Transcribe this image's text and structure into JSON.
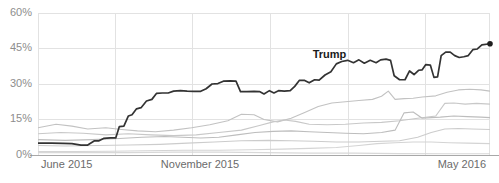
{
  "chart_data": {
    "type": "line",
    "title": "",
    "xlabel": "",
    "ylabel": "",
    "ylim": [
      0,
      60
    ],
    "yticks": [
      0,
      15,
      30,
      45,
      60
    ],
    "ytick_labels": [
      "0%",
      "15%",
      "30%",
      "45%",
      "60%"
    ],
    "xtick_labels": [
      "June 2015",
      "November 2015",
      "May 2016"
    ],
    "xlim": [
      "June 2015",
      "May 2016"
    ],
    "grid": true,
    "legend_position": "inline-annotation",
    "annotations": [
      {
        "text": "Trump",
        "x_frac": 0.645,
        "value": 41.5
      }
    ],
    "series": [
      {
        "name": "Trump",
        "color": "#333333",
        "highlight": true,
        "end_marker": true,
        "end_value": 47,
        "points": [
          [
            0.0,
            5.0
          ],
          [
            0.03,
            5.0
          ],
          [
            0.055,
            4.9
          ],
          [
            0.075,
            4.8
          ],
          [
            0.095,
            4.2
          ],
          [
            0.11,
            4.2
          ],
          [
            0.125,
            6.0
          ],
          [
            0.135,
            6.0
          ],
          [
            0.145,
            7.0
          ],
          [
            0.16,
            7.2
          ],
          [
            0.172,
            7.2
          ],
          [
            0.18,
            12.0
          ],
          [
            0.19,
            12.2
          ],
          [
            0.2,
            16.5
          ],
          [
            0.208,
            17.0
          ],
          [
            0.218,
            19.5
          ],
          [
            0.228,
            20.0
          ],
          [
            0.24,
            22.8
          ],
          [
            0.252,
            23.5
          ],
          [
            0.262,
            26.0
          ],
          [
            0.275,
            26.2
          ],
          [
            0.288,
            26.2
          ],
          [
            0.3,
            27.0
          ],
          [
            0.315,
            27.2
          ],
          [
            0.33,
            27.0
          ],
          [
            0.345,
            26.9
          ],
          [
            0.36,
            26.9
          ],
          [
            0.372,
            28.0
          ],
          [
            0.385,
            30.0
          ],
          [
            0.398,
            30.2
          ],
          [
            0.41,
            31.2
          ],
          [
            0.425,
            31.3
          ],
          [
            0.438,
            31.2
          ],
          [
            0.448,
            26.8
          ],
          [
            0.462,
            26.8
          ],
          [
            0.478,
            26.9
          ],
          [
            0.49,
            26.8
          ],
          [
            0.5,
            25.8
          ],
          [
            0.512,
            27.2
          ],
          [
            0.522,
            26.2
          ],
          [
            0.532,
            27.2
          ],
          [
            0.545,
            27.0
          ],
          [
            0.558,
            27.2
          ],
          [
            0.568,
            29.0
          ],
          [
            0.578,
            31.5
          ],
          [
            0.59,
            31.5
          ],
          [
            0.6,
            30.5
          ],
          [
            0.612,
            31.8
          ],
          [
            0.622,
            31.6
          ],
          [
            0.635,
            33.8
          ],
          [
            0.648,
            35.2
          ],
          [
            0.66,
            38.5
          ],
          [
            0.672,
            39.5
          ],
          [
            0.685,
            40.0
          ],
          [
            0.698,
            39.0
          ],
          [
            0.71,
            40.2
          ],
          [
            0.722,
            38.8
          ],
          [
            0.735,
            40.0
          ],
          [
            0.748,
            39.0
          ],
          [
            0.758,
            40.2
          ],
          [
            0.77,
            40.5
          ],
          [
            0.78,
            40.0
          ],
          [
            0.788,
            33.5
          ],
          [
            0.8,
            31.8
          ],
          [
            0.812,
            31.8
          ],
          [
            0.822,
            35.5
          ],
          [
            0.832,
            34.0
          ],
          [
            0.842,
            35.8
          ],
          [
            0.85,
            36.0
          ],
          [
            0.858,
            38.2
          ],
          [
            0.868,
            38.0
          ],
          [
            0.876,
            32.8
          ],
          [
            0.884,
            33.0
          ],
          [
            0.892,
            42.0
          ],
          [
            0.902,
            43.5
          ],
          [
            0.912,
            43.5
          ],
          [
            0.922,
            42.0
          ],
          [
            0.932,
            41.2
          ],
          [
            0.942,
            41.5
          ],
          [
            0.952,
            42.0
          ],
          [
            0.962,
            44.5
          ],
          [
            0.972,
            44.8
          ],
          [
            0.982,
            46.5
          ],
          [
            1.0,
            47.0
          ]
        ]
      },
      {
        "name": "series-2",
        "color": "#c2c2c2",
        "highlight": false,
        "points": [
          [
            0.0,
            11.5
          ],
          [
            0.04,
            13.0
          ],
          [
            0.075,
            12.2
          ],
          [
            0.11,
            11.0
          ],
          [
            0.15,
            11.5
          ],
          [
            0.185,
            10.8
          ],
          [
            0.22,
            10.2
          ],
          [
            0.26,
            9.8
          ],
          [
            0.3,
            10.5
          ],
          [
            0.34,
            11.5
          ],
          [
            0.38,
            12.8
          ],
          [
            0.42,
            14.5
          ],
          [
            0.45,
            17.2
          ],
          [
            0.478,
            17.0
          ],
          [
            0.5,
            15.0
          ],
          [
            0.53,
            14.0
          ],
          [
            0.56,
            15.5
          ],
          [
            0.59,
            18.0
          ],
          [
            0.62,
            20.5
          ],
          [
            0.65,
            22.0
          ],
          [
            0.68,
            22.5
          ],
          [
            0.71,
            23.0
          ],
          [
            0.74,
            23.5
          ],
          [
            0.76,
            24.8
          ],
          [
            0.775,
            27.0
          ],
          [
            0.79,
            23.5
          ],
          [
            0.81,
            23.8
          ],
          [
            0.83,
            24.0
          ],
          [
            0.85,
            24.5
          ],
          [
            0.88,
            25.0
          ],
          [
            0.905,
            26.5
          ],
          [
            0.93,
            27.5
          ],
          [
            0.955,
            27.8
          ],
          [
            0.98,
            27.5
          ],
          [
            1.0,
            27.0
          ]
        ]
      },
      {
        "name": "series-3",
        "color": "#c8c8c8",
        "highlight": false,
        "points": [
          [
            0.0,
            9.0
          ],
          [
            0.05,
            9.5
          ],
          [
            0.1,
            9.2
          ],
          [
            0.15,
            8.5
          ],
          [
            0.2,
            9.0
          ],
          [
            0.25,
            8.5
          ],
          [
            0.3,
            8.2
          ],
          [
            0.35,
            8.5
          ],
          [
            0.4,
            9.5
          ],
          [
            0.45,
            10.5
          ],
          [
            0.49,
            12.5
          ],
          [
            0.52,
            14.0
          ],
          [
            0.545,
            14.8
          ],
          [
            0.57,
            14.2
          ],
          [
            0.6,
            13.0
          ],
          [
            0.64,
            12.8
          ],
          [
            0.68,
            13.0
          ],
          [
            0.72,
            13.5
          ],
          [
            0.76,
            13.8
          ],
          [
            0.8,
            14.5
          ],
          [
            0.84,
            15.5
          ],
          [
            0.88,
            16.5
          ],
          [
            0.9,
            21.8
          ],
          [
            0.92,
            22.0
          ],
          [
            0.945,
            21.5
          ],
          [
            0.97,
            21.8
          ],
          [
            1.0,
            21.5
          ]
        ]
      },
      {
        "name": "series-4",
        "color": "#bdbdbd",
        "highlight": false,
        "points": [
          [
            0.0,
            6.5
          ],
          [
            0.06,
            6.2
          ],
          [
            0.12,
            6.5
          ],
          [
            0.18,
            7.0
          ],
          [
            0.23,
            7.5
          ],
          [
            0.28,
            7.8
          ],
          [
            0.32,
            7.5
          ],
          [
            0.36,
            7.2
          ],
          [
            0.4,
            7.5
          ],
          [
            0.44,
            8.5
          ],
          [
            0.48,
            9.5
          ],
          [
            0.52,
            10.0
          ],
          [
            0.56,
            10.2
          ],
          [
            0.6,
            9.8
          ],
          [
            0.64,
            9.5
          ],
          [
            0.68,
            9.2
          ],
          [
            0.72,
            9.0
          ],
          [
            0.76,
            9.5
          ],
          [
            0.79,
            10.5
          ],
          [
            0.81,
            17.8
          ],
          [
            0.83,
            18.2
          ],
          [
            0.85,
            15.5
          ],
          [
            0.87,
            15.8
          ],
          [
            0.89,
            16.0
          ],
          [
            0.92,
            16.5
          ],
          [
            0.95,
            16.2
          ],
          [
            0.98,
            16.0
          ],
          [
            1.0,
            15.8
          ]
        ]
      },
      {
        "name": "series-5",
        "color": "#cccccc",
        "highlight": false,
        "points": [
          [
            0.0,
            4.0
          ],
          [
            0.06,
            3.8
          ],
          [
            0.13,
            4.0
          ],
          [
            0.2,
            4.2
          ],
          [
            0.27,
            4.5
          ],
          [
            0.33,
            5.0
          ],
          [
            0.39,
            5.5
          ],
          [
            0.45,
            6.0
          ],
          [
            0.51,
            6.2
          ],
          [
            0.56,
            6.0
          ],
          [
            0.61,
            5.8
          ],
          [
            0.66,
            5.5
          ],
          [
            0.71,
            5.5
          ],
          [
            0.76,
            5.8
          ],
          [
            0.8,
            6.0
          ],
          [
            0.84,
            7.5
          ],
          [
            0.87,
            9.5
          ],
          [
            0.9,
            11.0
          ],
          [
            0.93,
            11.2
          ],
          [
            0.96,
            11.0
          ],
          [
            1.0,
            10.8
          ]
        ]
      },
      {
        "name": "series-6",
        "color": "#d4d4d4",
        "highlight": false,
        "points": [
          [
            0.0,
            1.5
          ],
          [
            0.08,
            1.5
          ],
          [
            0.16,
            1.6
          ],
          [
            0.24,
            1.8
          ],
          [
            0.32,
            2.0
          ],
          [
            0.4,
            2.0
          ],
          [
            0.47,
            2.2
          ],
          [
            0.54,
            2.5
          ],
          [
            0.6,
            2.8
          ],
          [
            0.66,
            3.2
          ],
          [
            0.71,
            4.0
          ],
          [
            0.75,
            4.8
          ],
          [
            0.79,
            5.2
          ],
          [
            0.83,
            5.5
          ],
          [
            0.87,
            5.5
          ],
          [
            0.91,
            5.2
          ],
          [
            0.95,
            5.0
          ],
          [
            1.0,
            4.8
          ]
        ]
      },
      {
        "name": "series-7",
        "color": "#d8d8d8",
        "highlight": false,
        "points": [
          [
            0.0,
            1.0
          ],
          [
            0.1,
            1.0
          ],
          [
            0.2,
            1.0
          ],
          [
            0.3,
            1.2
          ],
          [
            0.4,
            1.2
          ],
          [
            0.5,
            1.0
          ],
          [
            0.6,
            0.8
          ],
          [
            0.7,
            0.8
          ],
          [
            0.8,
            0.6
          ],
          [
            0.9,
            0.5
          ],
          [
            1.0,
            0.5
          ]
        ]
      }
    ]
  },
  "axis": {
    "ytick_labels": [
      "60%",
      "45%",
      "30%",
      "15%",
      "0%"
    ],
    "xtick_labels": [
      "June 2015",
      "November 2015",
      "May 2016"
    ]
  },
  "colors": {
    "main_line": "#333333",
    "gridline": "#e2e2e2",
    "baseline": "#a8a8a8",
    "ytick_text": "#8d8d8d",
    "xtick_text": "#6b6b6b",
    "annotation_text": "#1a1a1a"
  }
}
